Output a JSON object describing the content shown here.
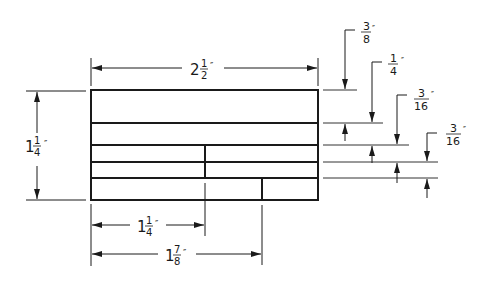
{
  "diagram": {
    "type": "dimensioned technical drawing",
    "units": "inches",
    "colors": {
      "line": "#1a1a1a",
      "thin_line": "#333333",
      "background": "#ffffff"
    },
    "overall": {
      "width": {
        "whole": "2",
        "num": "1",
        "den": "2",
        "mark": "″"
      },
      "height": {
        "whole": "1",
        "num": "1",
        "den": "4",
        "mark": "″"
      }
    },
    "bottom_dims": [
      {
        "whole": "1",
        "num": "1",
        "den": "4",
        "mark": "″"
      },
      {
        "whole": "1",
        "num": "7",
        "den": "8",
        "mark": "″"
      }
    ],
    "right_dims": [
      {
        "num": "3",
        "den": "8",
        "mark": "″"
      },
      {
        "num": "1",
        "den": "4",
        "mark": "″"
      },
      {
        "num": "3",
        "den": "16",
        "mark": "″"
      },
      {
        "num": "3",
        "den": "16",
        "mark": "″"
      }
    ]
  }
}
